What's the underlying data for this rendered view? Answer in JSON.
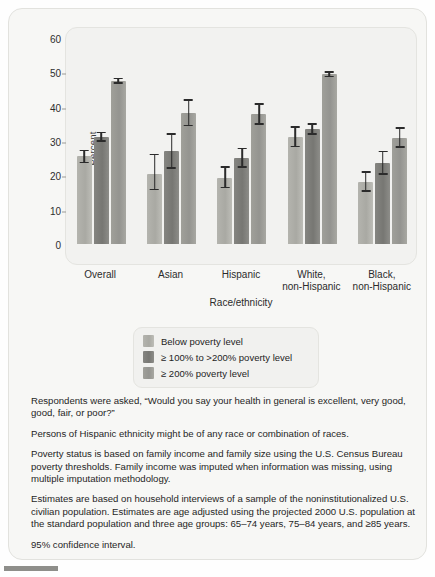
{
  "chart_data": {
    "type": "bar",
    "title": "",
    "xlabel": "Race/ethnicity",
    "ylabel": "Percent",
    "ylim": [
      0,
      60
    ],
    "yticks": [
      0,
      10,
      20,
      30,
      40,
      50,
      60
    ],
    "grid": false,
    "legend_position": "below-plot",
    "error_bars": "95% confidence interval",
    "categories": [
      "Overall",
      "Asian",
      "Hispanic",
      "White, non-Hispanic",
      "Black, non-Hispanic"
    ],
    "category_lines": [
      [
        "Overall"
      ],
      [
        "Asian"
      ],
      [
        "Hispanic"
      ],
      [
        "White,",
        "non-Hispanic"
      ],
      [
        "Black,",
        "non-Hispanic"
      ]
    ],
    "series": [
      {
        "name": "Below poverty level",
        "color": "#aeaea8",
        "values": [
          25.5,
          20.5,
          19.3,
          31.2,
          18.0
        ],
        "ci_low": [
          23.5,
          15.6,
          16.2,
          28.2,
          15.2
        ],
        "ci_high": [
          27.5,
          26.3,
          22.6,
          34.4,
          21.2
        ]
      },
      {
        "name": "≥ 100% to >200% poverty level",
        "color": "#7c7c78",
        "values": [
          31.3,
          27.0,
          25.0,
          33.5,
          23.7
        ],
        "ci_low": [
          29.8,
          21.9,
          22.2,
          31.8,
          20.2
        ],
        "ci_high": [
          32.7,
          32.2,
          28.0,
          35.2,
          27.2
        ]
      },
      {
        "name": "≥ 200% poverty level",
        "color": "#9a9a94",
        "values": [
          47.5,
          38.3,
          38.0,
          49.5,
          31.0
        ],
        "ci_low": [
          46.6,
          34.3,
          34.7,
          48.6,
          28.0
        ],
        "ci_high": [
          48.4,
          42.2,
          41.0,
          50.4,
          34.1
        ]
      }
    ]
  },
  "axes": {
    "y_title": "Percent",
    "x_title": "Race/ethnicity",
    "ytick_labels": [
      "60",
      "50",
      "40",
      "30",
      "20",
      "10",
      "0"
    ]
  },
  "legend": {
    "items": [
      {
        "label": "Below poverty level"
      },
      {
        "label": "≥ 100% to >200% poverty level"
      },
      {
        "label": "≥ 200% poverty level"
      }
    ]
  },
  "notes": [
    "Respondents were asked, “Would you say your health in general is excellent,  very good, good, fair, or poor?”",
    "Persons of Hispanic ethnicity might be of any race or combination of races.",
    "Poverty status is based on family income and family size using the U.S. Census Bureau poverty thresholds. Family income was imputed when information was missing, using multiple imputation methodology.",
    "Estimates are based on household interviews of a sample of the noninstitutionalized U.S. civilian population. Estimates are age adjusted using the projected 2000 U.S. population at the standard population and three age groups: 65–74 years, 75–84 years, and ≥85 years.",
    "95% confidence interval."
  ]
}
